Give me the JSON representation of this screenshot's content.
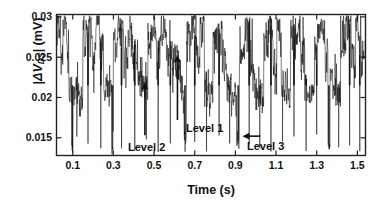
{
  "chart_data": {
    "type": "line",
    "title": "",
    "xlabel": "Time (s)",
    "ylabel": "|ΔV_DS| (mV)",
    "ylabel_parts": {
      "bar_open": "|",
      "delta": "Δ",
      "v": "V",
      "sub": "DS",
      "bar_close": "|",
      "unit": "(mV)"
    },
    "xlim": [
      0.02,
      1.54
    ],
    "ylim": [
      0.0128,
      0.0303
    ],
    "xticks": [
      0.1,
      0.3,
      0.5,
      0.7,
      0.9,
      1.1,
      1.3,
      1.5
    ],
    "xtick_labels": [
      "0.1",
      "0.3",
      "0.5",
      "0.7",
      "0.9",
      "1.1",
      "1.3",
      "1.5"
    ],
    "yticks": [
      0.015,
      0.02,
      0.025,
      0.03
    ],
    "ytick_labels": [
      "0.015",
      "0.02",
      "0.025",
      "0.03"
    ],
    "grid": false,
    "legend": false,
    "line_color": "#111111",
    "line_width": 0.55,
    "frame_color": "#222222",
    "background": "#ffffff",
    "annotations": [
      {
        "id": "level-1",
        "label": "Level 1",
        "arrow": "up",
        "x": 0.615,
        "y": 0.0253,
        "label_x": 0.72,
        "label_y": 0.0165
      },
      {
        "id": "level-2",
        "label": "Level 2",
        "arrow": "up",
        "x": 0.455,
        "y": 0.0219,
        "label_x": 0.5,
        "label_y": 0.0147
      },
      {
        "id": "level-3",
        "label": "Level 3",
        "arrow": "left",
        "x": 0.915,
        "y": 0.0152,
        "label_x": 1.05,
        "label_y": 0.0152
      }
    ],
    "levels": {
      "level_1": 0.0253,
      "level_2": 0.0219,
      "level_3": 0.0152
    },
    "series": [
      {
        "name": "|dVds|",
        "note": "Two-state-dominant RTN switching between a high band near 0.026-0.030 mV and a low band near 0.019-0.022 mV, punctuated by deep downward spikes to ~0.013-0.015 mV (Level 3).",
        "segments": [
          {
            "t0": 0.02,
            "t1": 0.04,
            "level": 0.0292,
            "noise": 0.0018
          },
          {
            "t0": 0.04,
            "t1": 0.052,
            "level": 0.0262,
            "noise": 0.0016
          },
          {
            "t0": 0.052,
            "t1": 0.07,
            "level": 0.0296,
            "noise": 0.0014
          },
          {
            "t0": 0.07,
            "t1": 0.082,
            "level": 0.0268,
            "noise": 0.0018
          },
          {
            "t0": 0.082,
            "t1": 0.096,
            "level": 0.0214,
            "noise": 0.0014
          },
          {
            "t0": 0.096,
            "t1": 0.101,
            "level": 0.014,
            "noise": 0.0008
          },
          {
            "t0": 0.101,
            "t1": 0.125,
            "level": 0.0212,
            "noise": 0.0016
          },
          {
            "t0": 0.125,
            "t1": 0.15,
            "level": 0.0206,
            "noise": 0.0014
          },
          {
            "t0": 0.15,
            "t1": 0.168,
            "level": 0.0278,
            "noise": 0.002
          },
          {
            "t0": 0.168,
            "t1": 0.196,
            "level": 0.0286,
            "noise": 0.0017
          },
          {
            "t0": 0.196,
            "t1": 0.214,
            "level": 0.0252,
            "noise": 0.0022
          },
          {
            "t0": 0.214,
            "t1": 0.232,
            "level": 0.0288,
            "noise": 0.0016
          },
          {
            "t0": 0.232,
            "t1": 0.252,
            "level": 0.0264,
            "noise": 0.002
          },
          {
            "t0": 0.252,
            "t1": 0.272,
            "level": 0.0218,
            "noise": 0.0016
          },
          {
            "t0": 0.272,
            "t1": 0.292,
            "level": 0.021,
            "noise": 0.0015
          },
          {
            "t0": 0.292,
            "t1": 0.3,
            "level": 0.0142,
            "noise": 0.0008
          },
          {
            "t0": 0.3,
            "t1": 0.322,
            "level": 0.0272,
            "noise": 0.002
          },
          {
            "t0": 0.322,
            "t1": 0.352,
            "level": 0.0286,
            "noise": 0.0016
          },
          {
            "t0": 0.352,
            "t1": 0.372,
            "level": 0.0258,
            "noise": 0.0022
          },
          {
            "t0": 0.372,
            "t1": 0.396,
            "level": 0.0284,
            "noise": 0.0016
          },
          {
            "t0": 0.396,
            "t1": 0.42,
            "level": 0.0262,
            "noise": 0.002
          },
          {
            "t0": 0.42,
            "t1": 0.444,
            "level": 0.022,
            "noise": 0.0015
          },
          {
            "t0": 0.444,
            "t1": 0.47,
            "level": 0.0216,
            "noise": 0.0014
          },
          {
            "t0": 0.47,
            "t1": 0.492,
            "level": 0.0276,
            "noise": 0.002
          },
          {
            "t0": 0.492,
            "t1": 0.512,
            "level": 0.029,
            "noise": 0.0015
          },
          {
            "t0": 0.512,
            "t1": 0.53,
            "level": 0.0256,
            "noise": 0.0022
          },
          {
            "t0": 0.53,
            "t1": 0.556,
            "level": 0.0288,
            "noise": 0.0016
          },
          {
            "t0": 0.556,
            "t1": 0.578,
            "level": 0.0268,
            "noise": 0.002
          },
          {
            "t0": 0.578,
            "t1": 0.6,
            "level": 0.0252,
            "noise": 0.0022
          },
          {
            "t0": 0.6,
            "t1": 0.628,
            "level": 0.025,
            "noise": 0.0018
          },
          {
            "t0": 0.628,
            "t1": 0.648,
            "level": 0.0214,
            "noise": 0.0016
          },
          {
            "t0": 0.648,
            "t1": 0.66,
            "level": 0.015,
            "noise": 0.001
          },
          {
            "t0": 0.66,
            "t1": 0.684,
            "level": 0.0282,
            "noise": 0.0018
          },
          {
            "t0": 0.684,
            "t1": 0.706,
            "level": 0.0292,
            "noise": 0.0014
          },
          {
            "t0": 0.706,
            "t1": 0.726,
            "level": 0.0258,
            "noise": 0.0022
          },
          {
            "t0": 0.726,
            "t1": 0.748,
            "level": 0.0286,
            "noise": 0.0016
          },
          {
            "t0": 0.748,
            "t1": 0.768,
            "level": 0.0222,
            "noise": 0.0016
          },
          {
            "t0": 0.768,
            "t1": 0.79,
            "level": 0.0208,
            "noise": 0.0015
          },
          {
            "t0": 0.79,
            "t1": 0.812,
            "level": 0.0272,
            "noise": 0.002
          },
          {
            "t0": 0.812,
            "t1": 0.836,
            "level": 0.0286,
            "noise": 0.0016
          },
          {
            "t0": 0.836,
            "t1": 0.858,
            "level": 0.0254,
            "noise": 0.0022
          },
          {
            "t0": 0.858,
            "t1": 0.88,
            "level": 0.0216,
            "noise": 0.0016
          },
          {
            "t0": 0.88,
            "t1": 0.906,
            "level": 0.0206,
            "noise": 0.0014
          },
          {
            "t0": 0.906,
            "t1": 0.92,
            "level": 0.015,
            "noise": 0.0009
          },
          {
            "t0": 0.92,
            "t1": 0.946,
            "level": 0.0272,
            "noise": 0.002
          },
          {
            "t0": 0.946,
            "t1": 0.972,
            "level": 0.0288,
            "noise": 0.0015
          },
          {
            "t0": 0.972,
            "t1": 0.992,
            "level": 0.0254,
            "noise": 0.0022
          },
          {
            "t0": 0.992,
            "t1": 1.014,
            "level": 0.0218,
            "noise": 0.0016
          },
          {
            "t0": 1.014,
            "t1": 1.04,
            "level": 0.021,
            "noise": 0.0014
          },
          {
            "t0": 1.04,
            "t1": 1.062,
            "level": 0.0276,
            "noise": 0.002
          },
          {
            "t0": 1.062,
            "t1": 1.086,
            "level": 0.029,
            "noise": 0.0015
          },
          {
            "t0": 1.086,
            "t1": 1.104,
            "level": 0.025,
            "noise": 0.0022
          },
          {
            "t0": 1.104,
            "t1": 1.126,
            "level": 0.0284,
            "noise": 0.0016
          },
          {
            "t0": 1.126,
            "t1": 1.15,
            "level": 0.022,
            "noise": 0.0016
          },
          {
            "t0": 1.15,
            "t1": 1.172,
            "level": 0.0208,
            "noise": 0.0014
          },
          {
            "t0": 1.172,
            "t1": 1.196,
            "level": 0.0278,
            "noise": 0.002
          },
          {
            "t0": 1.196,
            "t1": 1.22,
            "level": 0.0288,
            "noise": 0.0015
          },
          {
            "t0": 1.22,
            "t1": 1.242,
            "level": 0.0256,
            "noise": 0.0022
          },
          {
            "t0": 1.242,
            "t1": 1.266,
            "level": 0.0216,
            "noise": 0.0016
          },
          {
            "t0": 1.266,
            "t1": 1.29,
            "level": 0.0206,
            "noise": 0.0014
          },
          {
            "t0": 1.29,
            "t1": 1.316,
            "level": 0.0274,
            "noise": 0.002
          },
          {
            "t0": 1.316,
            "t1": 1.34,
            "level": 0.029,
            "noise": 0.0015
          },
          {
            "t0": 1.34,
            "t1": 1.356,
            "level": 0.0254,
            "noise": 0.0022
          },
          {
            "t0": 1.356,
            "t1": 1.366,
            "level": 0.0142,
            "noise": 0.0008
          },
          {
            "t0": 1.366,
            "t1": 1.392,
            "level": 0.0222,
            "noise": 0.0016
          },
          {
            "t0": 1.392,
            "t1": 1.418,
            "level": 0.0212,
            "noise": 0.0015
          },
          {
            "t0": 1.418,
            "t1": 1.444,
            "level": 0.028,
            "noise": 0.002
          },
          {
            "t0": 1.444,
            "t1": 1.47,
            "level": 0.029,
            "noise": 0.0015
          },
          {
            "t0": 1.47,
            "t1": 1.492,
            "level": 0.0258,
            "noise": 0.0022
          },
          {
            "t0": 1.492,
            "t1": 1.52,
            "level": 0.0286,
            "noise": 0.0016
          },
          {
            "t0": 1.52,
            "t1": 1.54,
            "level": 0.0252,
            "noise": 0.002
          }
        ]
      }
    ]
  }
}
